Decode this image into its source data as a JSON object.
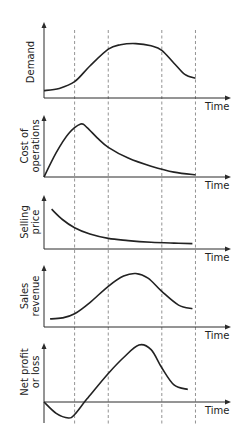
{
  "chart_data": {
    "type": "line",
    "title": "",
    "layout": "stacked-panels",
    "shared_x": {
      "label": "Time",
      "range": [
        0,
        100
      ],
      "phase_boundaries": [
        20,
        42,
        77,
        99
      ]
    },
    "grid": false,
    "panels": [
      {
        "name": "demand",
        "ylabel_lines": [
          "Demand"
        ],
        "xlabel": "Time",
        "ylim": [
          0,
          100
        ],
        "zero_axis_offset": 0,
        "x": [
          0,
          10,
          20,
          30,
          42,
          50,
          60,
          70,
          77,
          85,
          92,
          99
        ],
        "y": [
          6,
          10,
          22,
          50,
          80,
          88,
          90,
          86,
          78,
          55,
          35,
          28
        ]
      },
      {
        "name": "cost-of-operations",
        "ylabel_lines": [
          "Cost of",
          "operations"
        ],
        "xlabel": "Time",
        "ylim": [
          0,
          100
        ],
        "zero_axis_offset": 0,
        "x": [
          0,
          8,
          16,
          24,
          28,
          35,
          42,
          55,
          70,
          85,
          99
        ],
        "y": [
          0,
          45,
          80,
          98,
          92,
          72,
          55,
          35,
          20,
          9,
          4
        ]
      },
      {
        "name": "selling-price",
        "ylabel_lines": [
          "Selling",
          "price"
        ],
        "xlabel": "Time",
        "ylim": [
          0,
          100
        ],
        "zero_axis_offset": 0,
        "x": [
          5,
          12,
          20,
          30,
          42,
          55,
          70,
          85,
          97
        ],
        "y": [
          88,
          64,
          45,
          30,
          20,
          15,
          11,
          9,
          8
        ]
      },
      {
        "name": "sales-revenue",
        "ylabel_lines": [
          "Sales",
          "revenue"
        ],
        "xlabel": "Time",
        "ylim": [
          0,
          100
        ],
        "zero_axis_offset": 0,
        "x": [
          4,
          12,
          20,
          30,
          42,
          52,
          60,
          68,
          77,
          88,
          97
        ],
        "y": [
          8,
          10,
          18,
          40,
          72,
          92,
          97,
          88,
          62,
          35,
          28
        ]
      },
      {
        "name": "net-profit-or-loss",
        "ylabel_lines": [
          "Net profit",
          "or loss"
        ],
        "xlabel": "Time",
        "ylim": [
          -40,
          100
        ],
        "zero_axis_offset": 1,
        "x": [
          0,
          8,
          16,
          20,
          28,
          42,
          52,
          62,
          70,
          77,
          85,
          94
        ],
        "y": [
          0,
          -20,
          -28,
          -22,
          5,
          50,
          78,
          100,
          92,
          60,
          30,
          22
        ]
      }
    ]
  }
}
